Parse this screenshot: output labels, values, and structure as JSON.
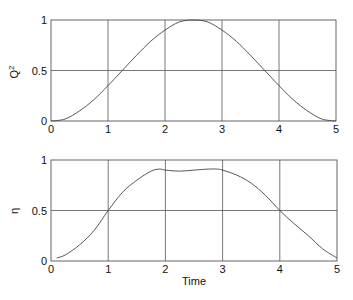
{
  "chart_data": [
    {
      "type": "line",
      "title": "",
      "xlabel": "",
      "ylabel": "Q",
      "ylabel_superscript": "2",
      "xlim": [
        0,
        5
      ],
      "ylim": [
        0,
        1
      ],
      "grid": true,
      "xticks": [
        "0",
        "1",
        "2",
        "3",
        "4",
        "5"
      ],
      "yticks": [
        "0",
        "0.5",
        "1"
      ],
      "series": [
        {
          "name": "Q^2",
          "x": [
            0,
            0.25,
            0.5,
            0.75,
            1.0,
            1.25,
            1.5,
            1.75,
            2.0,
            2.25,
            2.5,
            2.75,
            3.0,
            3.25,
            3.5,
            3.75,
            4.0,
            4.25,
            4.5,
            4.75,
            5.0
          ],
          "y": [
            0.0,
            0.02,
            0.1,
            0.21,
            0.35,
            0.5,
            0.65,
            0.79,
            0.9,
            0.98,
            1.0,
            0.98,
            0.9,
            0.79,
            0.65,
            0.5,
            0.35,
            0.21,
            0.1,
            0.02,
            0.0
          ]
        }
      ]
    },
    {
      "type": "line",
      "title": "",
      "xlabel": "Time",
      "ylabel": "η",
      "xlim": [
        0,
        5
      ],
      "ylim": [
        0,
        1
      ],
      "grid": true,
      "xticks": [
        "0",
        "1",
        "2",
        "3",
        "4",
        "5"
      ],
      "yticks": [
        "0",
        "0.5",
        "1"
      ],
      "series": [
        {
          "name": "eta",
          "x": [
            0.1,
            0.25,
            0.5,
            0.75,
            1.0,
            1.25,
            1.5,
            1.75,
            1.9,
            2.0,
            2.25,
            2.5,
            2.75,
            2.9,
            3.0,
            3.25,
            3.5,
            3.75,
            4.0,
            4.25,
            4.5,
            4.75,
            5.0
          ],
          "y": [
            0.03,
            0.06,
            0.16,
            0.3,
            0.5,
            0.68,
            0.8,
            0.89,
            0.91,
            0.9,
            0.89,
            0.9,
            0.91,
            0.91,
            0.9,
            0.85,
            0.77,
            0.65,
            0.5,
            0.37,
            0.25,
            0.12,
            0.03
          ]
        }
      ]
    }
  ]
}
